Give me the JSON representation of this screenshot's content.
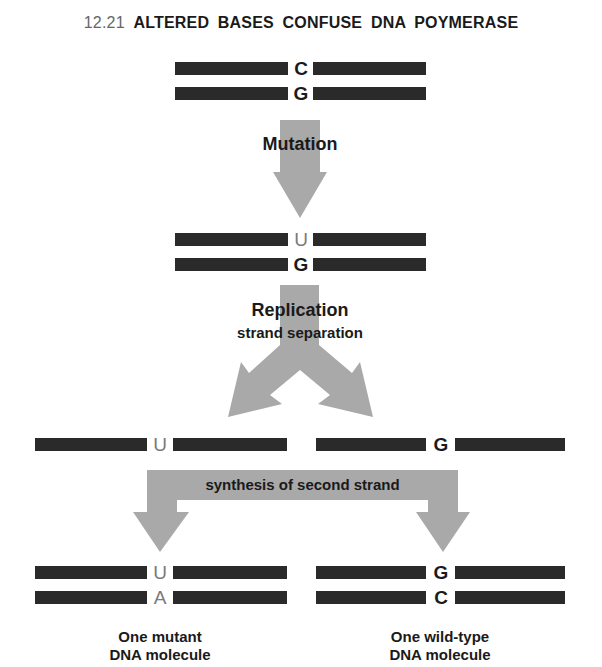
{
  "title": {
    "number": "12.21",
    "text": "ALTERED BASES CONFUSE DNA POYMERASE"
  },
  "steps": {
    "mutation": "Mutation",
    "replication": "Replication",
    "strand_separation": "strand separation",
    "synthesis": "synthesis of second strand"
  },
  "molecules": {
    "original": {
      "top_base": "C",
      "bottom_base": "G"
    },
    "mutated": {
      "top_base": "U",
      "bottom_base": "G"
    },
    "separated_left": {
      "base": "U"
    },
    "separated_right": {
      "base": "G"
    },
    "mutant": {
      "top_base": "U",
      "bottom_base": "A",
      "caption_line1": "One mutant",
      "caption_line2": "DNA molecule"
    },
    "wild_type": {
      "top_base": "G",
      "bottom_base": "C",
      "caption_line1": "One wild-type",
      "caption_line2": "DNA molecule"
    }
  },
  "colors": {
    "strand": "#2a2a2a",
    "arrow": "#a9a9a9",
    "altered_base": "#7a7a7a",
    "text": "#1a1a1a"
  }
}
